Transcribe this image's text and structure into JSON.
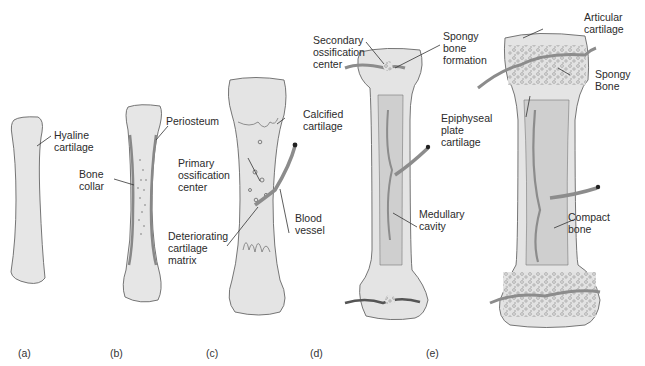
{
  "figure": {
    "colors": {
      "background": "#ffffff",
      "bone_fill": "#e4e4e4",
      "bone_outline": "#777777",
      "medullary_fill": "#c9c9c9",
      "vessel": "#8c8c8c",
      "leader_line": "#333333",
      "text": "#2b2b2b"
    }
  },
  "panels": [
    {
      "id": "a",
      "label": "(a)",
      "annotations": [
        "Hyaline\ncartilage"
      ]
    },
    {
      "id": "b",
      "label": "(b)",
      "annotations": [
        "Periosteum",
        "Bone\ncollar"
      ]
    },
    {
      "id": "c",
      "label": "(c)",
      "annotations": [
        "Calcified\ncartilage",
        "Primary\nossification\ncenter",
        "Deteriorating\ncartilage\nmatrix",
        "Blood\nvessel"
      ]
    },
    {
      "id": "d",
      "label": "(d)",
      "annotations": [
        "Secondary\nossification\ncenter",
        "Spongy\nbone\nformation",
        "Medullary\ncavity"
      ]
    },
    {
      "id": "e",
      "label": "(e)",
      "annotations": [
        "Articular\ncartilage",
        "Spongy\nBone",
        "Epiphyseal\nplate\ncartilage",
        "Compact\nbone"
      ]
    }
  ]
}
